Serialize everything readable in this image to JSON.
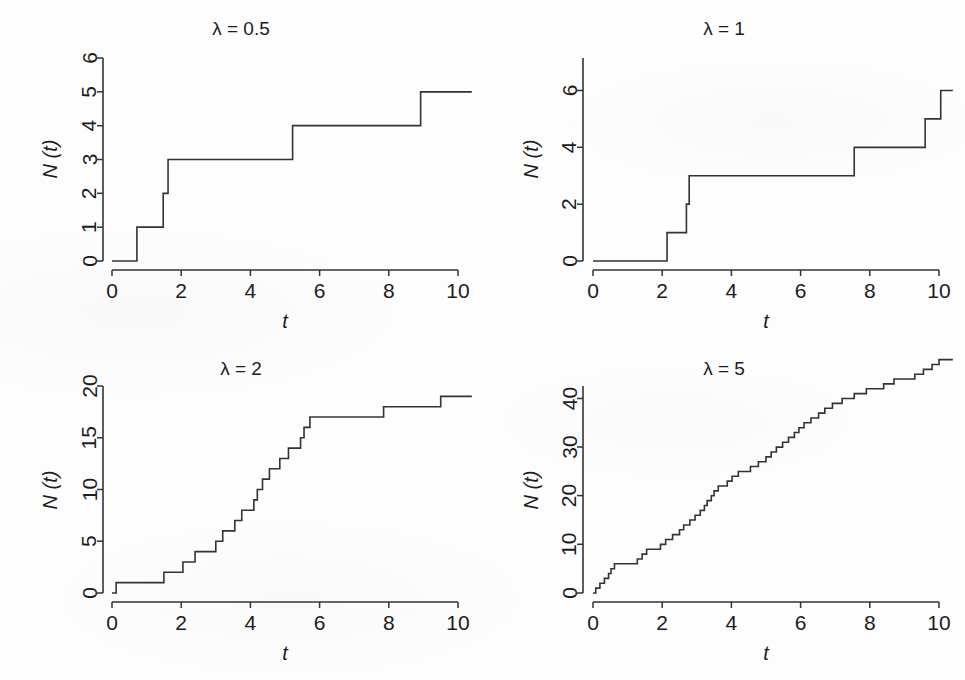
{
  "figure": {
    "layout": "2x2 grid of step-function plots",
    "background_color": "#fdfdfd",
    "line_color": "#333333"
  },
  "chart_data": [
    {
      "id": "lambda-0-5",
      "type": "line",
      "line_style": "step-post",
      "title": "λ = 0.5",
      "xlabel": "t",
      "ylabel": "N (t)",
      "xlim": [
        -0.4,
        10.4
      ],
      "ylim": [
        -0.35,
        6.3
      ],
      "xticks": [
        0,
        2,
        4,
        6,
        8,
        10
      ],
      "xtick_labels": [
        "0",
        "2",
        "4",
        "6",
        "8",
        "10"
      ],
      "yticks": [
        0,
        1,
        2,
        3,
        4,
        5,
        6
      ],
      "ytick_labels": [
        "0",
        "1",
        "2",
        "3",
        "4",
        "5",
        "6"
      ],
      "grid": false,
      "legend": null,
      "jump_times": [
        0.72,
        1.48,
        1.62,
        5.22,
        8.92
      ],
      "x": [
        0,
        0.72,
        0.72,
        1.48,
        1.48,
        1.62,
        1.62,
        5.22,
        5.22,
        8.92,
        8.92,
        10.4
      ],
      "y": [
        0,
        0,
        1,
        1,
        2,
        2,
        3,
        3,
        4,
        4,
        5,
        5
      ]
    },
    {
      "id": "lambda-1",
      "type": "line",
      "line_style": "step-post",
      "title": "λ = 1",
      "xlabel": "t",
      "ylabel": "N (t)",
      "xlim": [
        -0.4,
        10.4
      ],
      "ylim": [
        -0.4,
        7.1
      ],
      "xticks": [
        0,
        2,
        4,
        6,
        8,
        10
      ],
      "xtick_labels": [
        "0",
        "2",
        "4",
        "6",
        "8",
        "10"
      ],
      "yticks": [
        0,
        2,
        4,
        6
      ],
      "ytick_labels": [
        "0",
        "2",
        "4",
        "6"
      ],
      "grid": false,
      "legend": null,
      "jump_times": [
        2.14,
        2.7,
        2.78,
        7.55,
        9.6,
        10.05
      ],
      "x": [
        0,
        2.14,
        2.14,
        2.7,
        2.7,
        2.78,
        2.78,
        7.55,
        7.55,
        9.6,
        9.6,
        10.05,
        10.05,
        10.4
      ],
      "y": [
        0,
        0,
        1,
        1,
        2,
        2,
        3,
        3,
        4,
        4,
        5,
        5,
        6,
        6
      ]
    },
    {
      "id": "lambda-2",
      "type": "line",
      "line_style": "step-post",
      "title": "λ = 2",
      "xlabel": "t",
      "ylabel": "N (t)",
      "xlim": [
        -0.4,
        10.4
      ],
      "ylim": [
        -0.9,
        20.5
      ],
      "xticks": [
        0,
        2,
        4,
        6,
        8,
        10
      ],
      "xtick_labels": [
        "0",
        "2",
        "4",
        "6",
        "8",
        "10"
      ],
      "yticks": [
        0,
        5,
        10,
        15,
        20
      ],
      "ytick_labels": [
        "0",
        "5",
        "10",
        "15",
        "20"
      ],
      "grid": false,
      "legend": null,
      "jump_times": [
        0.12,
        1.5,
        2.05,
        2.4,
        3.0,
        3.2,
        3.55,
        3.75,
        4.1,
        4.2,
        4.35,
        4.55,
        4.85,
        5.1,
        5.45,
        5.55,
        5.72,
        7.85,
        9.5,
        9.62
      ],
      "x": [
        0,
        0.12,
        0.12,
        1.5,
        1.5,
        2.05,
        2.05,
        2.4,
        2.4,
        3.0,
        3.0,
        3.2,
        3.2,
        3.55,
        3.55,
        3.75,
        3.75,
        4.1,
        4.1,
        4.2,
        4.2,
        4.35,
        4.35,
        4.55,
        4.55,
        4.85,
        4.85,
        5.1,
        5.1,
        5.45,
        5.45,
        5.55,
        5.55,
        5.72,
        5.72,
        7.85,
        7.85,
        9.5,
        9.5,
        9.62,
        9.62,
        10.4
      ],
      "y": [
        0,
        0,
        1,
        1,
        2,
        2,
        3,
        3,
        4,
        4,
        5,
        5,
        6,
        6,
        7,
        7,
        8,
        8,
        9,
        9,
        10,
        10,
        11,
        11,
        12,
        12,
        13,
        13,
        14,
        14,
        15,
        15,
        16,
        16,
        17,
        17,
        18,
        18,
        19,
        19,
        19,
        19
      ]
    },
    {
      "id": "lambda-5",
      "type": "line",
      "line_style": "step-post",
      "title": "λ = 5",
      "xlabel": "t",
      "ylabel": "N (t)",
      "xlim": [
        -0.4,
        10.4
      ],
      "ylim": [
        -1.8,
        44.0
      ],
      "xticks": [
        0,
        2,
        4,
        6,
        8,
        10
      ],
      "xtick_labels": [
        "0",
        "2",
        "4",
        "6",
        "8",
        "10"
      ],
      "yticks": [
        0,
        10,
        20,
        30,
        40
      ],
      "ytick_labels": [
        "0",
        "10",
        "20",
        "30",
        "40"
      ],
      "grid": false,
      "legend": null,
      "jump_times": [
        0.08,
        0.2,
        0.33,
        0.45,
        0.52,
        0.62,
        1.28,
        1.42,
        1.55,
        1.95,
        2.1,
        2.3,
        2.5,
        2.62,
        2.8,
        2.95,
        3.1,
        3.22,
        3.3,
        3.42,
        3.5,
        3.62,
        3.88,
        4.02,
        4.2,
        4.55,
        4.78,
        5.0,
        5.15,
        5.3,
        5.48,
        5.65,
        5.82,
        5.95,
        6.1,
        6.3,
        6.52,
        6.7,
        6.92,
        7.2,
        7.55,
        7.9,
        8.4,
        8.7,
        9.3,
        9.55,
        9.8,
        10.0
      ],
      "final_count": 43,
      "y_counts": "unit jumps from 0 to 43"
    }
  ]
}
